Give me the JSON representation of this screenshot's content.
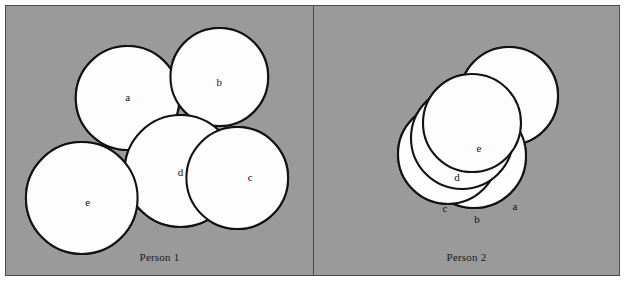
{
  "figure": {
    "width": 625,
    "height": 282,
    "background_color": "#ffffff",
    "panel_background_color": "#9a9a9a",
    "frame_color": "#4a4a4a",
    "circle_fill_color": "#fdfdfd",
    "circle_stroke_color": "#121212",
    "label_color": "#111111"
  },
  "panels": [
    {
      "id": "person-1",
      "caption": "Person 1",
      "viewbox": "0 0 308 269",
      "circles": [
        {
          "label": "a",
          "cx": 122,
          "cy": 92,
          "r": 52,
          "label_x": 122,
          "label_y": 92
        },
        {
          "label": "b",
          "cx": 214,
          "cy": 71,
          "r": 49,
          "label_x": 214,
          "label_y": 77
        },
        {
          "label": "d",
          "cx": 175,
          "cy": 165,
          "r": 56,
          "label_x": 175,
          "label_y": 167
        },
        {
          "label": "c",
          "cx": 232,
          "cy": 172,
          "r": 51,
          "label_x": 245,
          "label_y": 172
        },
        {
          "label": "e",
          "cx": 76,
          "cy": 192,
          "r": 56,
          "label_x": 82,
          "label_y": 197
        }
      ]
    },
    {
      "id": "person-2",
      "caption": "Person 2",
      "viewbox": "0 0 305 269",
      "circles": [
        {
          "label": "a",
          "cx": 195,
          "cy": 90,
          "r": 49,
          "label_x": 201,
          "label_y": 201
        },
        {
          "label": "b",
          "cx": 160,
          "cy": 150,
          "r": 52,
          "label_x": 163,
          "label_y": 214
        },
        {
          "label": "c",
          "cx": 134,
          "cy": 148,
          "r": 50,
          "label_x": 131,
          "label_y": 203
        },
        {
          "label": "d",
          "cx": 148,
          "cy": 132,
          "r": 51,
          "label_x": 143,
          "label_y": 172
        },
        {
          "label": "e",
          "cx": 158,
          "cy": 117,
          "r": 49,
          "label_x": 165,
          "label_y": 143
        }
      ]
    }
  ]
}
